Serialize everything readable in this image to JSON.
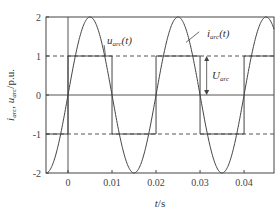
{
  "chart_data": {
    "type": "line",
    "title": "",
    "xlabel": "t/s",
    "ylabel": "i_arc, u_arc / p.u.",
    "xlim": [
      -0.005,
      0.0468
    ],
    "ylim": [
      -2,
      2
    ],
    "xticks": [
      0,
      0.01,
      0.02,
      0.03,
      0.04
    ],
    "xtick_labels": [
      "0",
      "0.01",
      "0.02",
      "0.03",
      "0.04"
    ],
    "yticks": [
      -2,
      -1,
      0,
      1,
      2
    ],
    "ytick_labels": [
      "-2",
      "-1",
      "0",
      "1",
      "2"
    ],
    "grid": false,
    "reference_lines": [
      {
        "type": "hline",
        "y": 1,
        "style": "dashed"
      },
      {
        "type": "hline",
        "y": -1,
        "style": "dashed"
      },
      {
        "type": "hline",
        "y": 0,
        "style": "solid"
      },
      {
        "type": "vline",
        "x": 0,
        "style": "solid"
      }
    ],
    "series": [
      {
        "name": "i_arc(t)",
        "kind": "sinusoid",
        "amplitude": 2,
        "period": 0.02,
        "phase_zero_crossing": 0,
        "x": [
          -0.005,
          -0.0025,
          0,
          0.0025,
          0.005,
          0.0075,
          0.01,
          0.0125,
          0.015,
          0.0175,
          0.02,
          0.0225,
          0.025,
          0.0275,
          0.03,
          0.0325,
          0.035,
          0.0375,
          0.04,
          0.0425,
          0.045
        ],
        "values": [
          -2,
          -1.414,
          0,
          1.414,
          2,
          1.414,
          0,
          -1.414,
          -2,
          -1.414,
          0,
          1.414,
          2,
          1.414,
          0,
          -1.414,
          -2,
          -1.414,
          0,
          1.414,
          2
        ]
      },
      {
        "name": "u_arc(t)",
        "kind": "square",
        "x": [
          -0.005,
          0,
          0,
          0.01,
          0.01,
          0.02,
          0.02,
          0.03,
          0.03,
          0.04,
          0.04,
          0.0468
        ],
        "values": [
          -1,
          -1,
          1,
          1,
          -1,
          -1,
          1,
          1,
          -1,
          -1,
          1,
          1
        ]
      }
    ],
    "annotations": [
      {
        "text": "u_arc(t)",
        "x": 0.0055,
        "y": 1.35,
        "arrow_to": [
          0.009,
          1.0
        ]
      },
      {
        "text": "i_arc(t)",
        "x": 0.031,
        "y": 1.7,
        "arrow_to": [
          0.0275,
          1.35
        ]
      },
      {
        "text": "U_arc",
        "x": 0.0325,
        "y": 0.5,
        "double_arrow": [
          [
            0.0315,
            1
          ],
          [
            0.0315,
            0
          ]
        ]
      }
    ]
  },
  "labels": {
    "xlabel_t": "t",
    "xlabel_unit": "/s",
    "ylabel_i": "i",
    "ylabel_i_sub": "arc",
    "ylabel_sep": ", ",
    "ylabel_u": "u",
    "ylabel_u_sub": "arc",
    "ylabel_unit": "/p.u.",
    "ann_u_main": "u",
    "ann_u_sub": "arc",
    "ann_u_arg": "(t)",
    "ann_i_main": "i",
    "ann_i_sub": "arc",
    "ann_i_arg": "(t)",
    "ann_U_main": "U",
    "ann_U_sub": "arc"
  }
}
